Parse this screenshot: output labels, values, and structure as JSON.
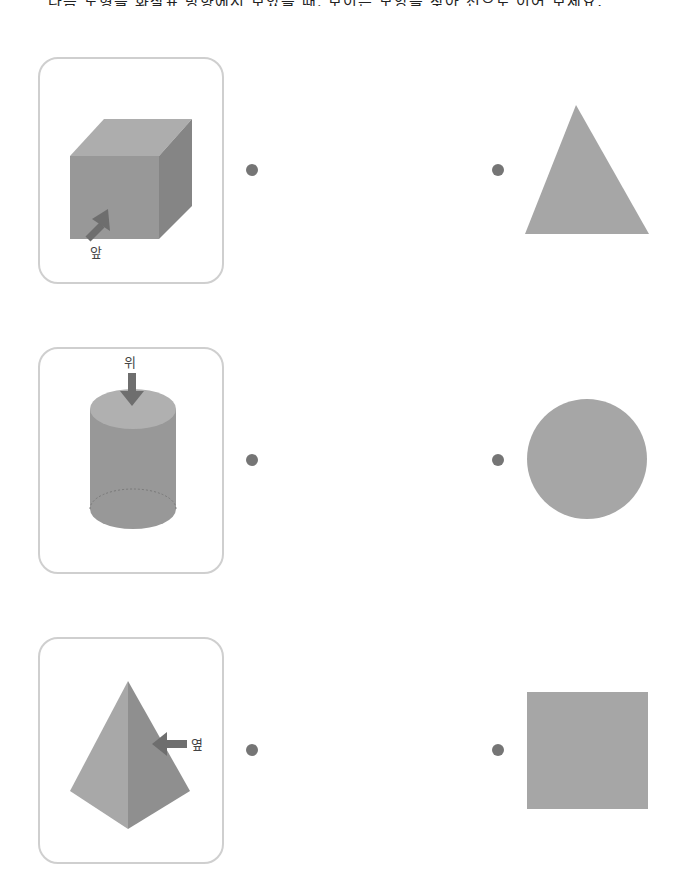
{
  "instruction": "다음 도형을 화살표 방향에서 보았을 때, 보이는 모양을 찾아 선으로 이어 보세요.",
  "colors": {
    "shape_fill": "#a6a6a6",
    "solid_front": "#989898",
    "solid_side": "#858585",
    "solid_top": "#adadad",
    "arrow": "#6e6e6e",
    "dot": "#757575",
    "card_border": "#cfcfcf"
  },
  "left_items": [
    {
      "solid": "cube",
      "arrow_label": "앞"
    },
    {
      "solid": "cylinder",
      "arrow_label": "위"
    },
    {
      "solid": "pyramid",
      "arrow_label": "옆"
    }
  ],
  "right_items": [
    {
      "shape": "triangle"
    },
    {
      "shape": "circle"
    },
    {
      "shape": "square"
    }
  ]
}
